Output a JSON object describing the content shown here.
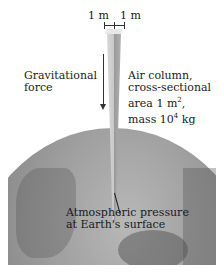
{
  "figure": {
    "dimension_left": "1 m",
    "dimension_right": "1 m",
    "gravity_label_line1": "Gravitational",
    "gravity_label_line2": "force",
    "column_label_line1": "Air column,",
    "column_label_line2": "cross-sectional",
    "column_label_line3_prefix": "area 1 m",
    "column_label_line3_sup": "2",
    "column_label_line3_suffix": ",",
    "column_label_line4_prefix": "mass 10",
    "column_label_line4_sup": "4",
    "column_label_line4_suffix": " kg",
    "surface_label_line1": "Atmospheric pressure",
    "surface_label_line2": "at Earth's surface"
  }
}
